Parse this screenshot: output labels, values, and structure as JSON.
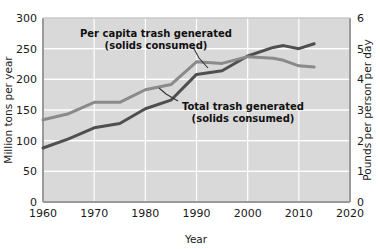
{
  "chart_data": {
    "type": "line",
    "title": "",
    "xlabel": "Year",
    "ylabel": "Million tons per year",
    "y2label": "Pounds per person per day",
    "xlim": [
      1960,
      2020
    ],
    "ylim": [
      0,
      300
    ],
    "y2lim": [
      0,
      6
    ],
    "grid": true,
    "legend_position": "inline-annotations",
    "xticks": [
      "1960",
      "1970",
      "1980",
      "1990",
      "2000",
      "2010",
      "2020"
    ],
    "xtick_values": [
      1960,
      1970,
      1980,
      1990,
      2000,
      2010,
      2020
    ],
    "yticks": [
      "0",
      "50",
      "100",
      "150",
      "200",
      "250",
      "300"
    ],
    "ytick_values": [
      0,
      50,
      100,
      150,
      200,
      250,
      300
    ],
    "y2ticks": [
      "0",
      "1",
      "2",
      "3",
      "4",
      "5",
      "6"
    ],
    "y2tick_values": [
      0,
      1,
      2,
      3,
      4,
      5,
      6
    ],
    "series": [
      {
        "name": "Total trash generated (solids consumed)",
        "axis": "left",
        "units": "million tons per year",
        "color": "#4f4f4f",
        "x": [
          1960,
          1965,
          1970,
          1975,
          1980,
          1985,
          1990,
          1995,
          2000,
          2005,
          2007,
          2010,
          2013
        ],
        "values": [
          88,
          103,
          121,
          128,
          152,
          166,
          208,
          214,
          238,
          252,
          255,
          250,
          258
        ]
      },
      {
        "name": "Per capita trash generated (solids consumed)",
        "axis": "right",
        "units": "pounds per person per day",
        "color": "#8a8a8a",
        "x": [
          1960,
          1965,
          1970,
          1975,
          1980,
          1985,
          1990,
          1995,
          2000,
          2005,
          2007,
          2010,
          2013
        ],
        "values": [
          2.68,
          2.88,
          3.25,
          3.25,
          3.66,
          3.83,
          4.57,
          4.52,
          4.74,
          4.69,
          4.62,
          4.44,
          4.4
        ]
      }
    ],
    "annotations": [
      {
        "id": "per-capita",
        "lines": [
          "Per capita trash generated",
          "(solids consumed)"
        ],
        "text": "Per capita trash generated (solids consumed)"
      },
      {
        "id": "total",
        "lines": [
          "Total trash generated",
          "(solids consumed)"
        ],
        "text": "Total trash generated (solids consumed)"
      }
    ],
    "colors": {
      "plot_background": "#d9d9d9",
      "gridline": "#ffffff",
      "axis": "#8f8f8f",
      "total_series": "#4f4f4f",
      "per_capita_series": "#8a8a8a",
      "text": "#1a1a1a",
      "page_background": "#ffffff"
    }
  }
}
